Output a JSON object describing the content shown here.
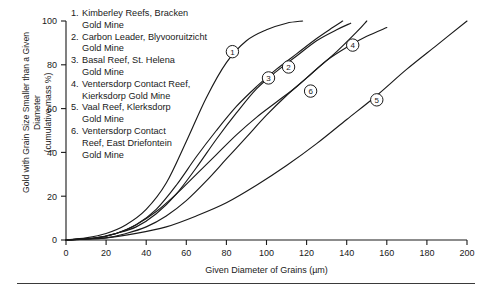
{
  "chart_data": {
    "type": "line",
    "title": "",
    "xlabel": "Given Diameter of Grains (µm)",
    "ylabel": "Gold with Grain Size Smaller than a Given Diameter (cumulative mass %)",
    "ylabel_line1": "Gold with Grain Size Smaller than a Given Diameter",
    "ylabel_line2": "(cumulative mass %)",
    "xlim": [
      0,
      200
    ],
    "ylim": [
      0,
      100
    ],
    "xticks": [
      0,
      20,
      40,
      60,
      80,
      100,
      120,
      140,
      160,
      180,
      200
    ],
    "yticks": [
      0,
      20,
      40,
      60,
      80,
      100
    ],
    "grid": false,
    "legend_position": "inside-top-left",
    "series": [
      {
        "name": "1. Kimberley Reefs, Bracken Gold Mine",
        "marker_label": "1",
        "marker_point": [
          83,
          86
        ],
        "points": [
          [
            0,
            0
          ],
          [
            10,
            1
          ],
          [
            20,
            3
          ],
          [
            30,
            7
          ],
          [
            40,
            14
          ],
          [
            50,
            26
          ],
          [
            60,
            45
          ],
          [
            70,
            65
          ],
          [
            80,
            81
          ],
          [
            90,
            91
          ],
          [
            100,
            96
          ],
          [
            110,
            99
          ],
          [
            118,
            100
          ]
        ]
      },
      {
        "name": "2. Carbon Leader, Blyvooruitzicht Gold Mine",
        "marker_label": "2",
        "marker_point": [
          111,
          79
        ],
        "points": [
          [
            0,
            0
          ],
          [
            15,
            1
          ],
          [
            25,
            3
          ],
          [
            35,
            6
          ],
          [
            45,
            12
          ],
          [
            55,
            21
          ],
          [
            65,
            33
          ],
          [
            75,
            46
          ],
          [
            85,
            58
          ],
          [
            95,
            69
          ],
          [
            105,
            77
          ],
          [
            115,
            84
          ],
          [
            125,
            91
          ],
          [
            135,
            96
          ],
          [
            142,
            99
          ]
        ]
      },
      {
        "name": "3. Basal Reef, St. Helena Gold Mine",
        "marker_label": "3",
        "marker_point": [
          101,
          74
        ],
        "points": [
          [
            0,
            0
          ],
          [
            15,
            1
          ],
          [
            25,
            3
          ],
          [
            35,
            7
          ],
          [
            45,
            14
          ],
          [
            55,
            25
          ],
          [
            65,
            38
          ],
          [
            75,
            50
          ],
          [
            85,
            61
          ],
          [
            95,
            70
          ],
          [
            105,
            78
          ],
          [
            115,
            85
          ],
          [
            125,
            92
          ],
          [
            133,
            97
          ],
          [
            138,
            100
          ]
        ]
      },
      {
        "name": "4. Ventersdorp Contact Reef, Kierksdorp Gold Mine",
        "marker_label": "4",
        "marker_point": [
          143,
          89
        ],
        "points": [
          [
            0,
            0
          ],
          [
            20,
            1
          ],
          [
            30,
            3
          ],
          [
            40,
            6
          ],
          [
            50,
            11
          ],
          [
            60,
            18
          ],
          [
            70,
            27
          ],
          [
            80,
            37
          ],
          [
            90,
            47
          ],
          [
            100,
            57
          ],
          [
            110,
            66
          ],
          [
            120,
            74
          ],
          [
            130,
            82
          ],
          [
            140,
            88
          ],
          [
            150,
            93
          ],
          [
            160,
            97
          ]
        ]
      },
      {
        "name": "5. Vaal Reef, Klerksdorp Gold Mine",
        "marker_label": "5",
        "marker_point": [
          155,
          64
        ],
        "points": [
          [
            0,
            0
          ],
          [
            20,
            1
          ],
          [
            35,
            3
          ],
          [
            50,
            6
          ],
          [
            65,
            11
          ],
          [
            80,
            17
          ],
          [
            95,
            25
          ],
          [
            110,
            34
          ],
          [
            125,
            44
          ],
          [
            140,
            55
          ],
          [
            155,
            66
          ],
          [
            170,
            78
          ],
          [
            185,
            89
          ],
          [
            200,
            100
          ]
        ]
      },
      {
        "name": "6. Ventersdorp Contact Reef, East Driefontein Gold Mine",
        "marker_label": "6",
        "marker_point": [
          122,
          68
        ],
        "points": [
          [
            0,
            0
          ],
          [
            15,
            1
          ],
          [
            25,
            3
          ],
          [
            35,
            7
          ],
          [
            45,
            13
          ],
          [
            55,
            21
          ],
          [
            65,
            30
          ],
          [
            75,
            39
          ],
          [
            85,
            48
          ],
          [
            95,
            56
          ],
          [
            105,
            63
          ],
          [
            115,
            70
          ],
          [
            125,
            78
          ],
          [
            135,
            86
          ],
          [
            145,
            95
          ],
          [
            150,
            100
          ]
        ]
      }
    ],
    "legend_entries": [
      {
        "num": "1.",
        "lines": [
          "Kimberley Reefs, Bracken",
          "Gold Mine"
        ]
      },
      {
        "num": "2.",
        "lines": [
          "Carbon Leader, Blyvooruitzicht",
          "Gold Mine"
        ]
      },
      {
        "num": "3.",
        "lines": [
          "Basal Reef, St. Helena",
          "Gold Mine"
        ]
      },
      {
        "num": "4.",
        "lines": [
          "Ventersdorp Contact Reef,",
          "Kierksdorp Gold Mine"
        ]
      },
      {
        "num": "5.",
        "lines": [
          "Vaal Reef, Klerksdorp",
          "Gold Mine"
        ]
      },
      {
        "num": "6.",
        "lines": [
          "Ventersdorp Contact",
          "Reef, East Driefontein",
          "Gold Mine"
        ]
      }
    ]
  },
  "colors": {
    "ink": "#1a1a1a",
    "background": "#ffffff",
    "rule": "#3a3a3a"
  }
}
